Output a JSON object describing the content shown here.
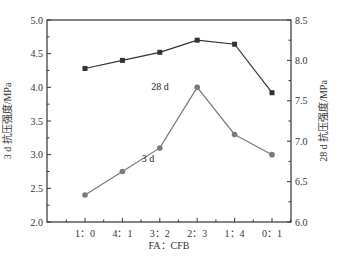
{
  "chart_data": {
    "type": "line",
    "title": "",
    "xlabel": "FA：CFB",
    "ylabel_left": "3 d 抗压强度/MPa",
    "ylabel_right": "28 d 抗压强度/MPa",
    "categories": [
      "1：0",
      "4：1",
      "3：2",
      "2：3",
      "1：4",
      "0：1"
    ],
    "ylim_left": [
      2.0,
      5.0
    ],
    "ylim_right": [
      6.0,
      8.5
    ],
    "yticks_left": [
      2.0,
      2.5,
      3.0,
      3.5,
      4.0,
      4.5,
      5.0
    ],
    "yticks_right": [
      6.0,
      6.5,
      7.0,
      7.5,
      8.0,
      8.5
    ],
    "grid": false,
    "legend": "inline labels",
    "series": [
      {
        "name": "28 d",
        "axis": "right",
        "marker": "square",
        "color": "#333333",
        "values": [
          7.9,
          8.0,
          8.1,
          8.25,
          8.2,
          7.6
        ],
        "label_pos": [
          160,
          90
        ]
      },
      {
        "name": "3 d",
        "axis": "left",
        "marker": "circle",
        "color": "#7a7a7a",
        "values": [
          2.4,
          2.75,
          3.1,
          4.0,
          3.3,
          3.0
        ],
        "label_pos": [
          148,
          162
        ]
      }
    ]
  }
}
